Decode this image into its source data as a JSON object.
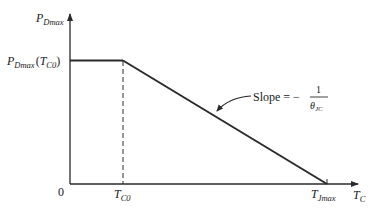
{
  "diagram": {
    "type": "derating-curve",
    "y_axis": {
      "label_main": "P",
      "label_sub": "Dmax"
    },
    "x_axis": {
      "label_main": "T",
      "label_sub": "C"
    },
    "origin_label": "0",
    "plateau_label": {
      "main": "P",
      "sub": "Dmax",
      "open": "(",
      "arg_main": "T",
      "arg_sub": "C0",
      "close": ")"
    },
    "tick_labels": [
      {
        "main": "T",
        "sub": "C0"
      },
      {
        "main": "T",
        "sub": "Jmax"
      }
    ],
    "annotation": {
      "prefix": "Slope = −",
      "numerator": "1",
      "denominator_main": "θ",
      "denominator_sub": "JC"
    },
    "colors": {
      "line": "#2a2a2a",
      "text": "#1a1a1a",
      "background": "#ffffff"
    }
  }
}
